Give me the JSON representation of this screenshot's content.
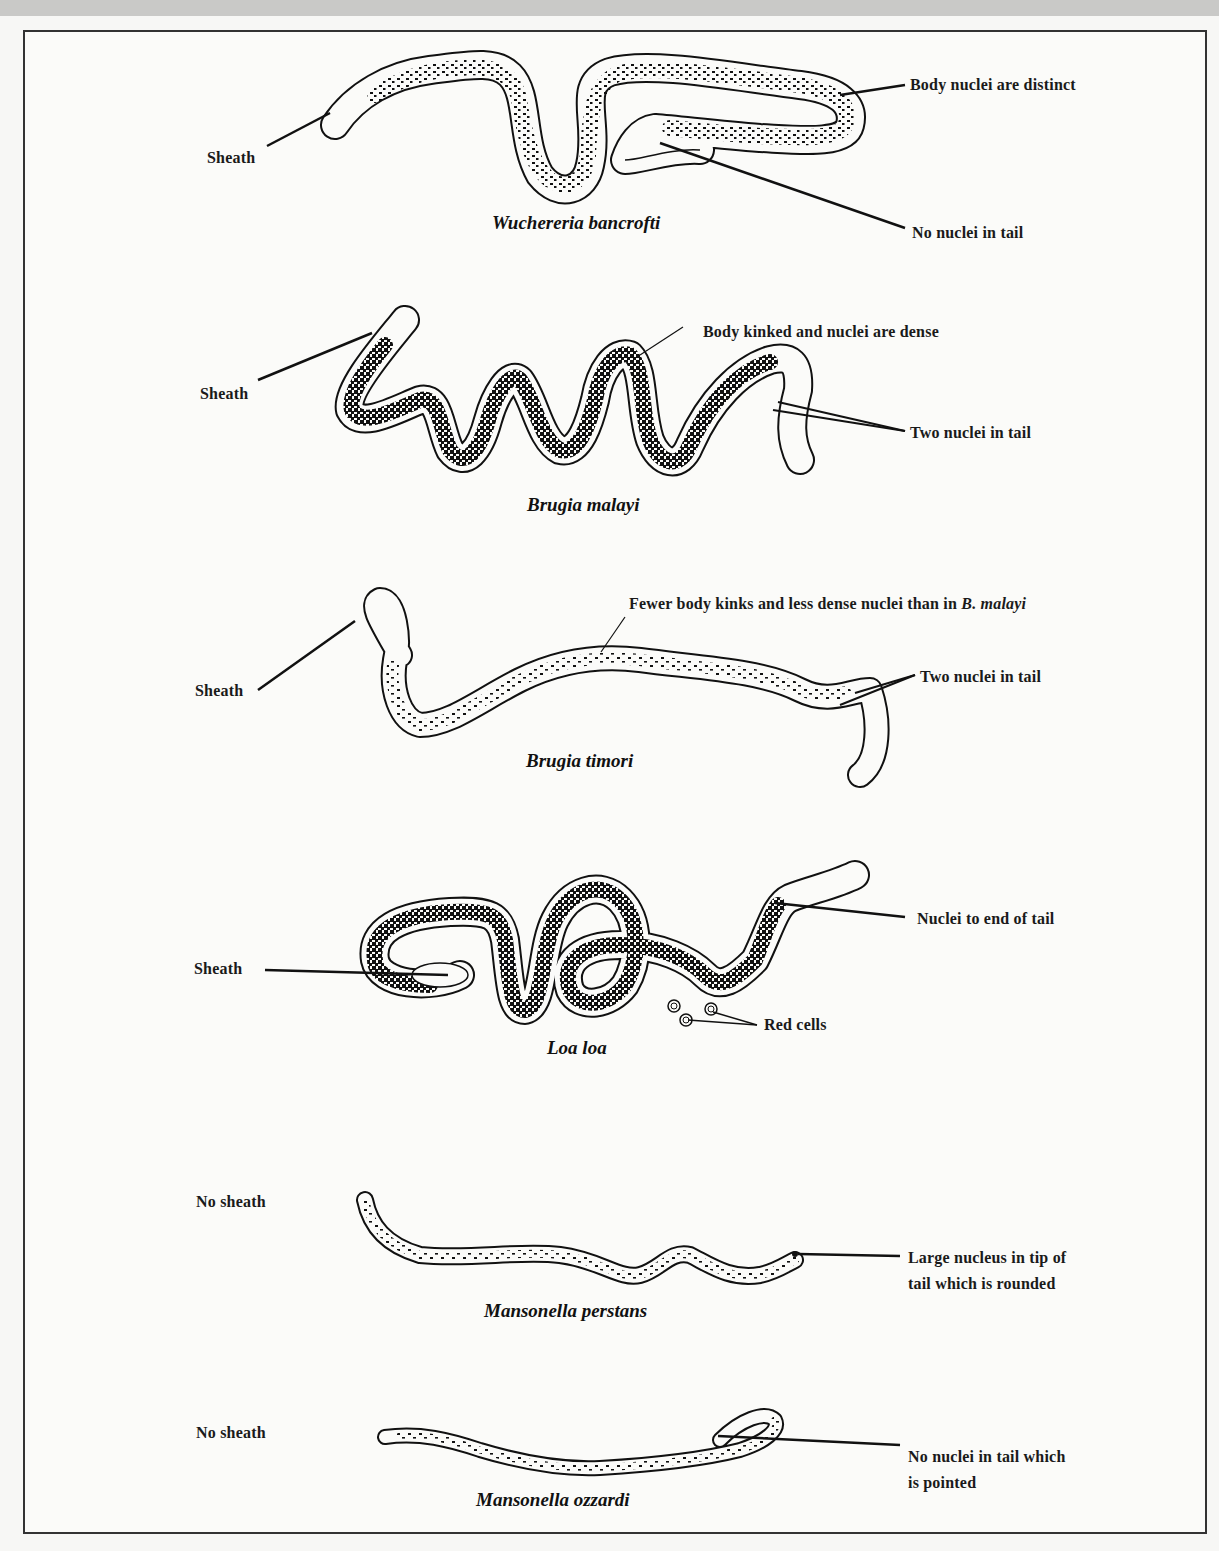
{
  "figure": {
    "panels": [
      {
        "id": "wuchereria",
        "species": "Wuchereria bancrofti",
        "labels": {
          "sheath": "Sheath",
          "body": "Body nuclei are distinct",
          "tail": "No nuclei in tail"
        }
      },
      {
        "id": "brugia-malayi",
        "species": "Brugia malayi",
        "labels": {
          "sheath": "Sheath",
          "body": "Body kinked and nuclei are dense",
          "tail": "Two nuclei in tail"
        }
      },
      {
        "id": "brugia-timori",
        "species": "Brugia timori",
        "labels": {
          "sheath": "Sheath",
          "body_prefix": "Fewer body kinks and less dense nuclei than in ",
          "body_italic": "B. malayi",
          "tail": "Two nuclei in tail"
        }
      },
      {
        "id": "loa-loa",
        "species": "Loa loa",
        "labels": {
          "sheath": "Sheath",
          "tail": "Nuclei to end of tail",
          "red_cells": "Red cells"
        }
      },
      {
        "id": "mansonella-perstans",
        "species": "Mansonella perstans",
        "labels": {
          "sheath": "No sheath",
          "tail_line1": "Large nucleus in tip of",
          "tail_line2": "tail which is rounded"
        }
      },
      {
        "id": "mansonella-ozzardi",
        "species": "Mansonella ozzardi",
        "labels": {
          "sheath": "No sheath",
          "tail_line1": "No nuclei in tail which",
          "tail_line2": "is pointed"
        }
      }
    ]
  }
}
